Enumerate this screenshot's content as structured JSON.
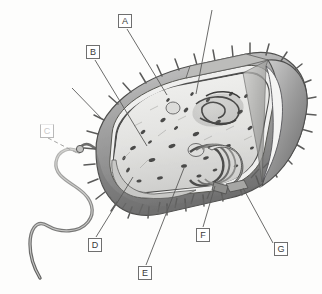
{
  "figure": {
    "style": "grayscale pen-and-ink scientific illustration",
    "background_color": "#fdfdfc",
    "ink_color": "#4a4a4a",
    "box_border_color": "#6f6f6f",
    "box_fill_color": "#ffffff"
  },
  "labels": [
    {
      "id": "A",
      "text": "A",
      "x": 118,
      "y": 14,
      "faint": false,
      "leader": {
        "x1": 127,
        "y1": 29,
        "x2": 167,
        "y2": 95
      }
    },
    {
      "id": "B",
      "text": "B",
      "x": 86,
      "y": 45,
      "faint": false,
      "leader": {
        "x1": 95,
        "y1": 60,
        "x2": 147,
        "y2": 146
      }
    },
    {
      "id": "C",
      "text": "C",
      "x": 40,
      "y": 124,
      "faint": true,
      "leader": {
        "x1": 48,
        "y1": 138,
        "x2": 77,
        "y2": 153
      }
    },
    {
      "id": "D",
      "text": "D",
      "x": 88,
      "y": 238,
      "faint": false,
      "leader": {
        "x1": 96,
        "y1": 237,
        "x2": 133,
        "y2": 177
      }
    },
    {
      "id": "E",
      "text": "E",
      "x": 138,
      "y": 266,
      "faint": false,
      "leader": {
        "x1": 146,
        "y1": 265,
        "x2": 184,
        "y2": 168
      }
    },
    {
      "id": "F",
      "text": "F",
      "x": 196,
      "y": 228,
      "faint": false,
      "leader": {
        "x1": 203,
        "y1": 227,
        "x2": 215,
        "y2": 186
      }
    },
    {
      "id": "G",
      "text": "G",
      "x": 274,
      "y": 242,
      "faint": false,
      "leader": {
        "x1": 273,
        "y1": 243,
        "x2": 243,
        "y2": 188
      }
    }
  ],
  "unlabeled_leaders": [
    {
      "name": "top-right-leader",
      "x1": 212,
      "y1": 10,
      "x2": 196,
      "y2": 94
    },
    {
      "name": "upper-left-leader",
      "x1": 72,
      "y1": 88,
      "x2": 104,
      "y2": 121
    }
  ],
  "structures": [
    {
      "name": "flagellum",
      "description": "long wavy whip-like tail extending left and down"
    },
    {
      "name": "basal-body",
      "description": "flagellar hook and basal body anchoring into the cell envelope"
    },
    {
      "name": "cell-wall",
      "description": "thick outer shaded envelope of the rod-shaped cell"
    },
    {
      "name": "plasma-membrane",
      "description": "inner membrane layer just under the wall"
    },
    {
      "name": "pili",
      "description": "short spikes (fimbriae) projecting all around the cell surface"
    },
    {
      "name": "cytoplasm",
      "description": "stippled interior containing ribosomes"
    },
    {
      "name": "ribosomes",
      "description": "small dark granules scattered through the cytoplasm"
    },
    {
      "name": "nucleoid",
      "description": "tangled DNA strand region in the upper-right cutaway"
    },
    {
      "name": "mesosome",
      "description": "folded membrane invagination at lower right"
    },
    {
      "name": "cutaway-end",
      "description": "sliced open rounded end revealing interior layers"
    }
  ]
}
